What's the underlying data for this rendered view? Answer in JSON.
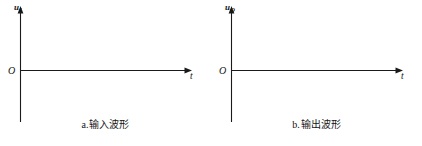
{
  "figure": {
    "panels": [
      {
        "id": "input-waveform",
        "y_axis_label_base": "u",
        "y_axis_label_sub": "I",
        "x_axis_label": "t",
        "origin_label": "O",
        "caption_letter": "a.",
        "caption_text": "输入波形",
        "axis_color": "#1a1a1a",
        "plot_series": []
      },
      {
        "id": "output-waveform",
        "y_axis_label_base": "u",
        "y_axis_label_sub": "O",
        "x_axis_label": "t",
        "origin_label": "O",
        "caption_letter": "b.",
        "caption_text": "输出波形",
        "axis_color": "#1a1a1a",
        "plot_series": []
      }
    ],
    "background_color": "#ffffff"
  }
}
